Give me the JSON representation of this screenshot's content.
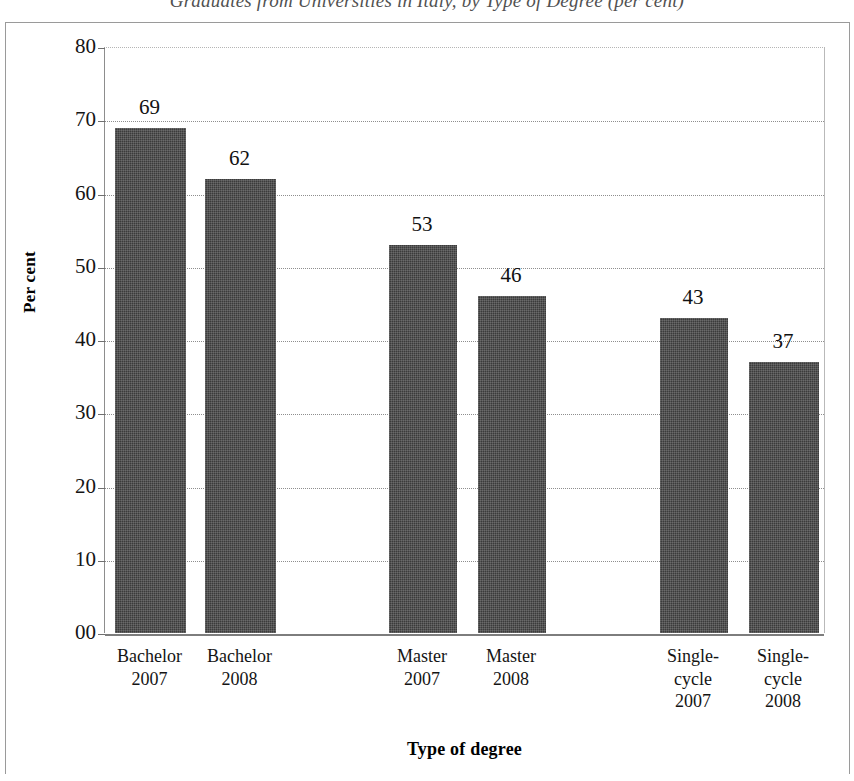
{
  "figure": {
    "title": "Graduates from Universities in Italy, by Type of Degree (per cent)"
  },
  "chart_data": {
    "type": "bar",
    "title": "Graduates from Universities in Italy, by Type of Degree (per cent)",
    "xlabel": "Type of degree",
    "ylabel": "Per cent",
    "ylim": [
      0,
      80
    ],
    "ytick_labels": [
      "80",
      "70",
      "60",
      "50",
      "40",
      "30",
      "20",
      "10",
      "00"
    ],
    "ytick_values": [
      80,
      70,
      60,
      50,
      40,
      30,
      20,
      10,
      0
    ],
    "grid": true,
    "legend": "none",
    "bar_color": "#3b3b3b",
    "categories": [
      "Bachelor 2007",
      "Bachelor 2008",
      "Master 2007",
      "Master 2008",
      "Single-cycle 2007",
      "Single-cycle 2008"
    ],
    "category_lines": [
      [
        "Bachelor",
        "2007"
      ],
      [
        "Bachelor",
        "2008"
      ],
      [
        "Master",
        "2007"
      ],
      [
        "Master",
        "2008"
      ],
      [
        "Single-",
        "cycle",
        "2007"
      ],
      [
        "Single-",
        "cycle",
        "2008"
      ]
    ],
    "values": [
      69,
      62,
      53,
      46,
      43,
      37
    ],
    "data_labels": [
      "69",
      "62",
      "53",
      "46",
      "43",
      "37"
    ]
  }
}
